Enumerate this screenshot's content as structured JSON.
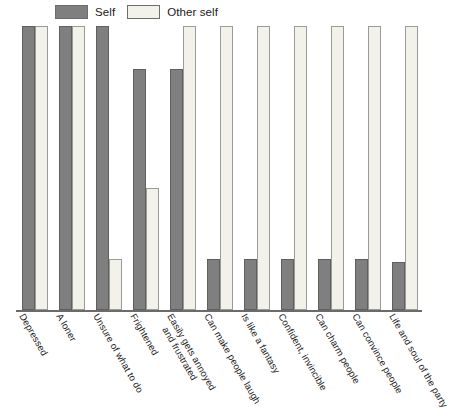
{
  "legend": {
    "position": "top-left",
    "entries": [
      {
        "name": "legend-self",
        "label": "Self",
        "color": "#7f7f7f"
      },
      {
        "name": "legend-other-self",
        "label": "Other self",
        "color": "#f2f1ea"
      }
    ]
  },
  "chart_data": {
    "type": "bar",
    "title": "",
    "subtitle": "",
    "xlabel": "",
    "ylabel": "",
    "ylim": [
      0,
      100
    ],
    "grid": false,
    "legend_position": "top-left",
    "categories": [
      "Depressed",
      "A loner",
      "Unsure of what to do",
      "Frightened",
      "Easily gets annoyed and frustrated",
      "Can make people laugh",
      "Is like a fantasy",
      "Confident, invincible",
      "Can charm people",
      "Can convince people",
      "Life and soul of the party"
    ],
    "category_lines": [
      [
        "Depressed"
      ],
      [
        "A loner"
      ],
      [
        "Unsure of what to do"
      ],
      [
        "Frightened"
      ],
      [
        "Easily gets annoyed",
        "and frustrated"
      ],
      [
        "Can make people laugh"
      ],
      [
        "Is like a fantasy"
      ],
      [
        "Confident, invincible"
      ],
      [
        "Can charm people"
      ],
      [
        "Can convince people"
      ],
      [
        "Life and soul of the party"
      ]
    ],
    "series": [
      {
        "name": "Self",
        "color": "#7f7f7f",
        "values": [
          100,
          100,
          100,
          85,
          85,
          18,
          18,
          18,
          18,
          18,
          17
        ]
      },
      {
        "name": "Other self",
        "color": "#f2f1ea",
        "values": [
          100,
          100,
          18,
          43,
          100,
          100,
          100,
          100,
          100,
          100,
          100
        ]
      }
    ]
  }
}
